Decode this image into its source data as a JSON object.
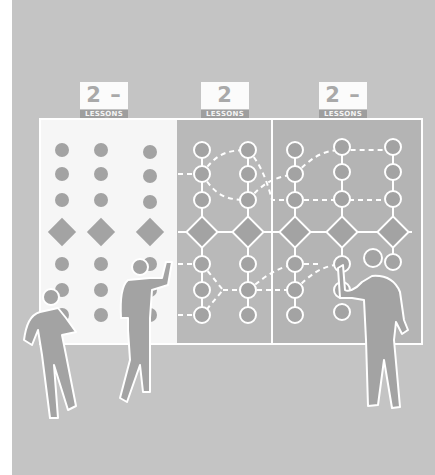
{
  "illustration": {
    "title": "Lesson progression board with three stages",
    "colors": {
      "background": "#c4c4c4",
      "panel_left": "#f6f6f6",
      "panel_middle": "#b9b9b9",
      "panel_right": "#b4b4b4",
      "node_fill": "#a3a3a3",
      "line": "#ffffff",
      "label_num_bg": "#fbfbfb",
      "label_sub_bg": "#9e9e9e"
    },
    "stages": [
      {
        "id": "stage-1",
        "count_label": "2 – 3",
        "unit_label": "LESSONS",
        "style": "unconnected dots"
      },
      {
        "id": "stage-2",
        "count_label": "2",
        "unit_label": "LESSONS",
        "style": "connected nodes"
      },
      {
        "id": "stage-3",
        "count_label": "2 – 3",
        "unit_label": "LESSONS",
        "style": "connected nodes"
      }
    ],
    "columns_per_stage": [
      3,
      2,
      3
    ],
    "node_rows": [
      "circle",
      "circle",
      "circle",
      "diamond",
      "circle",
      "circle",
      "circle"
    ],
    "figures": [
      {
        "id": "figure-left",
        "pose": "hand on chin, looking at board"
      },
      {
        "id": "figure-middle",
        "pose": "reaching toward board"
      },
      {
        "id": "figure-right",
        "pose": "pointing at node on board"
      }
    ]
  }
}
